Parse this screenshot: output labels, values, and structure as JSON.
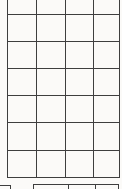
{
  "document": {
    "kind": "blank-table-grid",
    "background_color": "#fbfaf8",
    "line_color": "#3e3e3e"
  },
  "main_grid": {
    "columns": 4,
    "visible_rows": 7,
    "top_row_cut_off": true,
    "cell_text": "",
    "left_x": 7,
    "right_x": 120,
    "top_y": 0,
    "bottom_y": 178,
    "vertical_lines_x": [
      7,
      36,
      65,
      93,
      119
    ],
    "horizontal_lines_y": [
      14,
      41,
      68,
      95,
      122,
      150,
      177
    ]
  },
  "lower_grid_partial": {
    "top_y": 184,
    "left_x": 33,
    "right_x": 119,
    "vertical_stubs_x": [
      33,
      68,
      95,
      118
    ],
    "stub_bottom_y": 189
  },
  "corner_box_partial": {
    "top_y": 185,
    "left_x": 0,
    "right_x": 10,
    "stub_bottom_y": 189
  }
}
